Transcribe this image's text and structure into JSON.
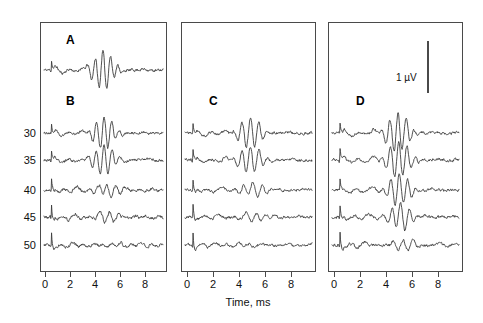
{
  "figure": {
    "background": "#ffffff",
    "trace_color": "#3c3c3c",
    "frame_color": "#4a4a4a",
    "panels": [
      {
        "id": "panel-1",
        "labels": [
          "A",
          "B"
        ],
        "x": 40,
        "y": 22,
        "width": 127,
        "height": 250
      },
      {
        "id": "panel-2",
        "labels": [
          "C"
        ],
        "x": 181,
        "y": 22,
        "width": 135,
        "height": 250
      },
      {
        "id": "panel-3",
        "labels": [
          "D"
        ],
        "x": 328,
        "y": 22,
        "width": 135,
        "height": 250
      }
    ]
  },
  "axes": {
    "xlabel": "Time, ms",
    "xticks": [
      0,
      2,
      4,
      6,
      8
    ],
    "xlim": [
      -0.6,
      9.4
    ],
    "yticks": [
      30,
      35,
      40,
      45,
      50
    ],
    "minor_xticks": [
      1,
      3,
      5,
      7,
      9
    ]
  },
  "scalebar": {
    "label": "1 µV",
    "value": 1,
    "unit": "µV"
  },
  "chart_data": {
    "type": "line",
    "title": "",
    "xlabel": "Time, ms",
    "ylabel": "",
    "xlim": [
      -0.6,
      9.4
    ],
    "grid": false,
    "legend": null,
    "panels": [
      {
        "name": "panel-1",
        "panel_labels": [
          "A",
          "B"
        ],
        "traces": [
          {
            "name": "A",
            "row_label": "A",
            "baseline_y": 70
          },
          {
            "name": "B-30",
            "row_label": "30",
            "baseline_y": 133
          },
          {
            "name": "B-35",
            "row_label": "35",
            "baseline_y": 160
          },
          {
            "name": "B-40",
            "row_label": "40",
            "baseline_y": 190
          },
          {
            "name": "B-45",
            "row_label": "45",
            "baseline_y": 217
          },
          {
            "name": "B-50",
            "row_label": "50",
            "baseline_y": 245
          }
        ]
      },
      {
        "name": "panel-2",
        "panel_labels": [
          "C"
        ],
        "traces": [
          {
            "name": "C-30",
            "row_label": "30",
            "baseline_y": 133
          },
          {
            "name": "C-35",
            "row_label": "35",
            "baseline_y": 160
          },
          {
            "name": "C-40",
            "row_label": "40",
            "baseline_y": 190
          },
          {
            "name": "C-45",
            "row_label": "45",
            "baseline_y": 217
          },
          {
            "name": "C-50",
            "row_label": "50",
            "baseline_y": 245
          }
        ]
      },
      {
        "name": "panel-3",
        "panel_labels": [
          "D"
        ],
        "traces": [
          {
            "name": "D-30",
            "row_label": "30",
            "baseline_y": 133
          },
          {
            "name": "D-35",
            "row_label": "35",
            "baseline_y": 160
          },
          {
            "name": "D-40",
            "row_label": "40",
            "baseline_y": 190
          },
          {
            "name": "D-45",
            "row_label": "45",
            "baseline_y": 217
          },
          {
            "name": "D-50",
            "row_label": "50",
            "baseline_y": 245
          }
        ]
      }
    ]
  }
}
